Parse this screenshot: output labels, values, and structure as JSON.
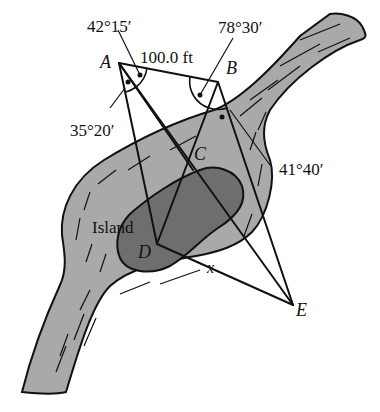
{
  "figure": {
    "type": "surveying diagram"
  },
  "points": {
    "A": "A",
    "B": "B",
    "C": "C",
    "D": "D",
    "E": "E"
  },
  "labels": {
    "distance_AB": "100.0 ft",
    "angle_A_upper": "42°15′",
    "angle_A_lower": "35°20′",
    "angle_B_upper": "78°30′",
    "angle_B_lower": "41°40′",
    "island": "Island",
    "unknown": "x"
  },
  "colors": {
    "water": "#a9a9a9",
    "island": "#6e6e6e",
    "ink": "#111111",
    "background": "#ffffff"
  }
}
